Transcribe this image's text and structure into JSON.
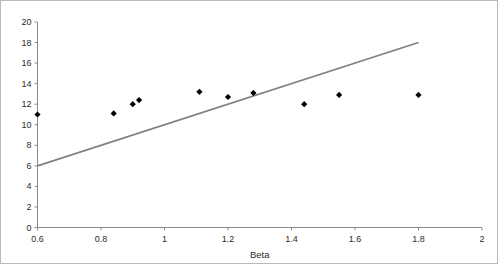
{
  "chart_data": {
    "type": "scatter",
    "title": "",
    "subtitle": "",
    "xlabel": "Beta",
    "ylabel": "",
    "xlim": [
      0.6,
      2.0
    ],
    "ylim": [
      0,
      20
    ],
    "xticks": [
      "0.6",
      "0.8",
      "1",
      "1.2",
      "1.4",
      "1.6",
      "1.8",
      "2"
    ],
    "xtick_values": [
      0.6,
      0.8,
      1.0,
      1.2,
      1.4,
      1.6,
      1.8,
      2.0
    ],
    "yticks": [
      "0",
      "2",
      "4",
      "6",
      "8",
      "10",
      "12",
      "14",
      "16",
      "18",
      "20"
    ],
    "ytick_values": [
      0,
      2,
      4,
      6,
      8,
      10,
      12,
      14,
      16,
      18,
      20
    ],
    "grid": false,
    "legend": null,
    "series": [
      {
        "name": "observations",
        "type": "scatter",
        "marker": "diamond",
        "color": "#000000",
        "points": [
          {
            "x": 0.6,
            "y": 11.0
          },
          {
            "x": 0.84,
            "y": 11.1
          },
          {
            "x": 0.9,
            "y": 12.0
          },
          {
            "x": 0.92,
            "y": 12.4
          },
          {
            "x": 1.11,
            "y": 13.2
          },
          {
            "x": 1.2,
            "y": 12.7
          },
          {
            "x": 1.28,
            "y": 13.1
          },
          {
            "x": 1.44,
            "y": 12.0
          },
          {
            "x": 1.55,
            "y": 12.9
          },
          {
            "x": 1.8,
            "y": 12.9
          }
        ]
      },
      {
        "name": "trend-line",
        "type": "line",
        "color": "#808080",
        "points": [
          {
            "x": 0.6,
            "y": 6.0
          },
          {
            "x": 1.8,
            "y": 18.0
          }
        ]
      }
    ]
  },
  "axes": {
    "x_title": "Beta"
  }
}
